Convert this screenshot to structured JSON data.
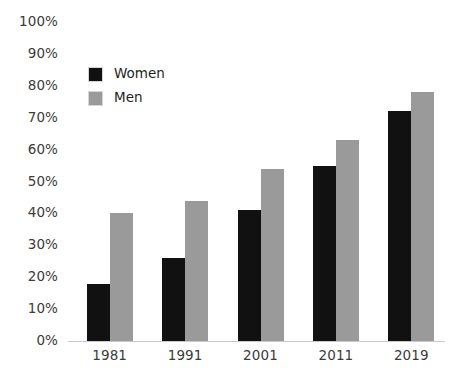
{
  "chart_data": {
    "type": "bar",
    "title": "",
    "subtitle": "",
    "xlabel": "",
    "ylabel": "",
    "categories": [
      "1981",
      "1991",
      "2001",
      "2011",
      "2019"
    ],
    "series": [
      {
        "name": "Women",
        "color": "#111111",
        "values": [
          18,
          26,
          41,
          55,
          72
        ]
      },
      {
        "name": "Men",
        "color": "#9a9a9a",
        "values": [
          40,
          44,
          54,
          63,
          78
        ]
      }
    ],
    "ylim": [
      0,
      100
    ],
    "y_tick_values": [
      0,
      10,
      20,
      30,
      40,
      50,
      60,
      70,
      80,
      90,
      100
    ],
    "y_tick_labels": [
      "0%",
      "10%",
      "20%",
      "30%",
      "40%",
      "50%",
      "60%",
      "70%",
      "80%",
      "90%",
      "100%"
    ],
    "value_format": "percent",
    "grid": false,
    "legend_position": "top-left",
    "axis_line_color": "#c9c9c9",
    "tick_label_color": "#3b3b3b",
    "background": "#ffffff"
  },
  "legend": {
    "items": [
      {
        "label": "Women",
        "color": "#111111"
      },
      {
        "label": "Men",
        "color": "#9a9a9a"
      }
    ]
  }
}
